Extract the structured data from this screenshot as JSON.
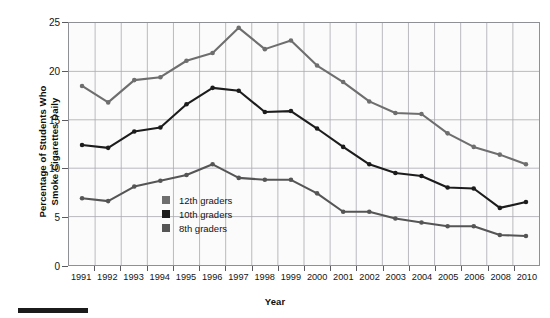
{
  "chart_data": {
    "type": "line",
    "title": "",
    "xlabel": "Year",
    "ylabel": "Percentage of Students Who\nSmoke Cigarettes Daily",
    "categories": [
      "1991",
      "1992",
      "1993",
      "1994",
      "1995",
      "1996",
      "1997",
      "1998",
      "1999",
      "2000",
      "2001",
      "2002",
      "2003",
      "2004",
      "2005",
      "2006",
      "2008",
      "2010"
    ],
    "xtick_labels": [
      "1991",
      "1992",
      "1993",
      "1994",
      "1995",
      "1996",
      "1997",
      "1998",
      "1999",
      "2000",
      "2001",
      "2002",
      "2003",
      "2004",
      "2005",
      "2006",
      "2008",
      "2010"
    ],
    "ytick_labels": [
      "0",
      "5",
      "10",
      "15",
      "20",
      "25"
    ],
    "ytick_values": [
      0,
      5,
      10,
      15,
      20,
      25
    ],
    "ylim": [
      0,
      25
    ],
    "grid": true,
    "legend_position": "inside-lower-left",
    "series": [
      {
        "name": "12th graders",
        "color": "#6e6e6e",
        "values": [
          18.5,
          16.8,
          19.1,
          19.4,
          21.1,
          21.9,
          24.5,
          22.3,
          23.2,
          20.6,
          18.9,
          16.9,
          15.7,
          15.6,
          13.6,
          12.2,
          11.4,
          10.4
        ]
      },
      {
        "name": "10th graders",
        "color": "#1c1c1c",
        "values": [
          12.4,
          12.1,
          13.8,
          14.2,
          16.6,
          18.3,
          18.0,
          15.8,
          15.9,
          14.1,
          12.2,
          10.4,
          9.5,
          9.2,
          8.0,
          7.9,
          5.9,
          6.5
        ]
      },
      {
        "name": "8th graders",
        "color": "#555555",
        "values": [
          6.9,
          6.6,
          8.1,
          8.7,
          9.3,
          10.4,
          9.0,
          8.8,
          8.8,
          7.4,
          5.5,
          5.5,
          4.8,
          4.4,
          4.0,
          4.0,
          3.1,
          3.0
        ]
      }
    ]
  },
  "legend": {
    "items": [
      {
        "label": "12th graders",
        "color": "#6e6e6e"
      },
      {
        "label": "10th graders",
        "color": "#1c1c1c"
      },
      {
        "label": "8th graders",
        "color": "#555555"
      }
    ]
  },
  "axes": {
    "x_title": "Year",
    "y_title": "Percentage of Students Who\nSmoke Cigarettes Daily"
  }
}
